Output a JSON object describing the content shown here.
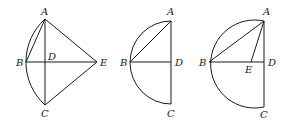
{
  "figures": [
    {
      "id": "figure-1",
      "labels": {
        "A": "A",
        "B": "B",
        "C": "C",
        "D": "D",
        "E": "E"
      },
      "points": {
        "A": [
          45,
          19
        ],
        "B": [
          26,
          62
        ],
        "C": [
          45,
          105
        ],
        "D": [
          45,
          62
        ],
        "E": [
          97,
          62
        ]
      },
      "segments": [
        "AB",
        "AC",
        "BE",
        "AE",
        "CE"
      ],
      "arc": {
        "through": [
          "A",
          "B",
          "C"
        ],
        "center": [
          84,
          62
        ],
        "radius": 58
      }
    },
    {
      "id": "figure-2",
      "labels": {
        "A": "A",
        "B": "B",
        "C": "C",
        "D": "D"
      },
      "points": {
        "A": [
          171,
          21
        ],
        "B": [
          130,
          62
        ],
        "C": [
          171,
          104
        ],
        "D": [
          171,
          62
        ]
      },
      "segments": [
        "AB",
        "AC",
        "BD"
      ],
      "arc": {
        "through": [
          "A",
          "B",
          "C"
        ],
        "center": [
          171,
          62
        ],
        "radius": 41
      }
    },
    {
      "id": "figure-3",
      "labels": {
        "A": "A",
        "B": "B",
        "C": "C",
        "D": "D",
        "E": "E"
      },
      "points": {
        "A": [
          264,
          21
        ],
        "B": [
          209,
          62
        ],
        "C": [
          264,
          107
        ],
        "D": [
          264,
          62
        ],
        "E": [
          251,
          62
        ]
      },
      "segments": [
        "AB",
        "AE",
        "AC",
        "BD"
      ],
      "arc": {
        "through": [
          "A",
          "B",
          "C"
        ],
        "center": [
          253,
          64
        ],
        "radius": 44
      }
    }
  ],
  "colors": {
    "stroke": "#1a1a1a",
    "background": "#ffffff"
  }
}
